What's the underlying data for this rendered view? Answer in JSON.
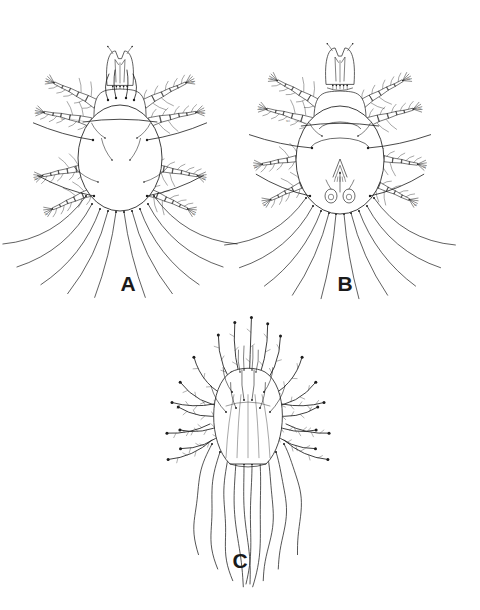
{
  "figure": {
    "type": "scientific-line-drawing",
    "background_color": "#ffffff",
    "ink_color": "#1c1c1c",
    "fine_ink_color": "#3a3a3a",
    "pale_ink_color": "#707070",
    "width": 480,
    "height": 610,
    "panel_count": 3
  },
  "panels": [
    {
      "id": "A",
      "label": "A",
      "view": "dorsal",
      "label_x": 128,
      "label_y": 291,
      "center_x": 120,
      "center_y": 150,
      "body": {
        "cx": 120,
        "cy": 158,
        "rx": 42,
        "ry": 53,
        "shield_top_y": 96,
        "shield_rx": 26,
        "shield_ry": 22,
        "shield_cy": 110,
        "transverse_suture_y": 120
      },
      "gnathosoma": {
        "cx": 120,
        "cy": 68,
        "width": 26,
        "height": 34
      },
      "legs": [
        {
          "name": "leg-I-left",
          "hx": 96,
          "hy": 104,
          "angle": 207,
          "segments": [
            11,
            10,
            9,
            8,
            9
          ],
          "width": 9,
          "taper": 0.74,
          "setae": 7,
          "tip_label": true
        },
        {
          "name": "leg-II-left",
          "hx": 90,
          "hy": 122,
          "angle": 192,
          "segments": [
            11,
            10,
            9,
            8,
            9
          ],
          "width": 9,
          "taper": 0.74,
          "setae": 6,
          "tip_label": true
        },
        {
          "name": "leg-III-left",
          "hx": 86,
          "hy": 168,
          "angle": 170,
          "segments": [
            10,
            9,
            9,
            8,
            8
          ],
          "width": 8,
          "taper": 0.76,
          "setae": 5,
          "tip_label": true
        },
        {
          "name": "leg-IV-left",
          "hx": 92,
          "hy": 192,
          "angle": 157,
          "segments": [
            10,
            9,
            8,
            8,
            8
          ],
          "width": 8,
          "taper": 0.76,
          "setae": 5,
          "tip_label": true
        },
        {
          "name": "leg-I-right",
          "hx": 144,
          "hy": 104,
          "angle": -27,
          "segments": [
            11,
            10,
            9,
            8,
            9
          ],
          "width": 9,
          "taper": 0.74,
          "setae": 7,
          "tip_label": true
        },
        {
          "name": "leg-II-right",
          "hx": 150,
          "hy": 122,
          "angle": -12,
          "segments": [
            11,
            10,
            9,
            8,
            9
          ],
          "width": 9,
          "taper": 0.74,
          "setae": 6,
          "tip_label": true
        },
        {
          "name": "leg-III-right",
          "hx": 154,
          "hy": 168,
          "angle": 10,
          "segments": [
            10,
            9,
            9,
            8,
            8
          ],
          "width": 8,
          "taper": 0.76,
          "setae": 5,
          "tip_label": true
        },
        {
          "name": "leg-IV-right",
          "hx": 148,
          "hy": 192,
          "angle": 23,
          "segments": [
            10,
            9,
            8,
            8,
            8
          ],
          "width": 8,
          "taper": 0.76,
          "setae": 5,
          "tip_label": true
        }
      ],
      "dorsal_setae": [
        {
          "x": 108,
          "y": 100,
          "angle": 272,
          "len": 26,
          "curve": -6,
          "weight": "heavy"
        },
        {
          "x": 116,
          "y": 98,
          "angle": 268,
          "len": 28,
          "curve": -3,
          "weight": "heavy"
        },
        {
          "x": 126,
          "y": 98,
          "angle": 272,
          "len": 28,
          "curve": 3,
          "weight": "heavy"
        },
        {
          "x": 134,
          "y": 100,
          "angle": 268,
          "len": 26,
          "curve": 6,
          "weight": "heavy"
        },
        {
          "x": 93,
          "y": 140,
          "angle": 196,
          "len": 62,
          "curve": -4,
          "weight": "heavy"
        },
        {
          "x": 147,
          "y": 140,
          "angle": -16,
          "len": 62,
          "curve": 4,
          "weight": "heavy"
        },
        {
          "x": 105,
          "y": 138,
          "angle": 228,
          "len": 20,
          "curve": -3,
          "weight": "light"
        },
        {
          "x": 137,
          "y": 138,
          "angle": -48,
          "len": 20,
          "curve": 3,
          "weight": "light"
        },
        {
          "x": 112,
          "y": 160,
          "angle": 244,
          "len": 24,
          "curve": -3,
          "weight": "light"
        },
        {
          "x": 130,
          "y": 160,
          "angle": -64,
          "len": 24,
          "curve": 3,
          "weight": "light"
        },
        {
          "x": 98,
          "y": 182,
          "angle": 212,
          "len": 28,
          "curve": -4,
          "weight": "light"
        },
        {
          "x": 144,
          "y": 182,
          "angle": -32,
          "len": 28,
          "curve": 4,
          "weight": "light"
        },
        {
          "x": 94,
          "y": 196,
          "angle": 200,
          "len": 60,
          "curve": -5,
          "weight": "heavy"
        },
        {
          "x": 147,
          "y": 196,
          "angle": -20,
          "len": 60,
          "curve": 5,
          "weight": "heavy"
        }
      ],
      "caudal_setae": [
        {
          "x": 86,
          "y": 196,
          "angle": 150,
          "len": 96,
          "curve": -22
        },
        {
          "x": 92,
          "y": 204,
          "angle": 140,
          "len": 98,
          "curve": -20
        },
        {
          "x": 100,
          "y": 209,
          "angle": 128,
          "len": 96,
          "curve": -16
        },
        {
          "x": 108,
          "y": 211,
          "angle": 116,
          "len": 92,
          "curve": -10
        },
        {
          "x": 116,
          "y": 212,
          "angle": 104,
          "len": 88,
          "curve": -5
        },
        {
          "x": 124,
          "y": 212,
          "angle": 76,
          "len": 88,
          "curve": 5
        },
        {
          "x": 132,
          "y": 211,
          "angle": 64,
          "len": 92,
          "curve": 10
        },
        {
          "x": 140,
          "y": 209,
          "angle": 52,
          "len": 96,
          "curve": 16
        },
        {
          "x": 148,
          "y": 204,
          "angle": 40,
          "len": 98,
          "curve": 20
        },
        {
          "x": 154,
          "y": 196,
          "angle": 30,
          "len": 96,
          "curve": 22
        }
      ],
      "micro_labels": [
        {
          "text": "sci",
          "x": 63,
          "y": 120,
          "leader_x2": 88,
          "leader_y2": 122
        }
      ]
    },
    {
      "id": "B",
      "label": "B",
      "view": "ventral",
      "label_x": 345,
      "label_y": 291,
      "center_x": 340,
      "center_y": 150,
      "body": {
        "cx": 340,
        "cy": 160,
        "rx": 44,
        "ry": 54,
        "shield_top_y": 98,
        "shield_rx": 26,
        "shield_ry": 22,
        "shield_cy": 112,
        "transverse_suture_y": 124
      },
      "gnathosoma": {
        "cx": 340,
        "cy": 66,
        "width": 28,
        "height": 36
      },
      "legs": [
        {
          "name": "leg-I-left",
          "hx": 318,
          "hy": 104,
          "angle": 210,
          "segments": [
            11,
            10,
            9,
            8,
            9
          ],
          "width": 9,
          "taper": 0.74,
          "setae": 7,
          "tip_label": true
        },
        {
          "name": "leg-II-left",
          "hx": 312,
          "hy": 122,
          "angle": 196,
          "segments": [
            11,
            10,
            9,
            8,
            9
          ],
          "width": 9,
          "taper": 0.74,
          "setae": 6,
          "tip_label": true
        },
        {
          "name": "leg-III-left",
          "hx": 306,
          "hy": 158,
          "angle": 172,
          "segments": [
            10,
            9,
            9,
            8,
            8
          ],
          "width": 8,
          "taper": 0.76,
          "setae": 5,
          "tip_label": true
        },
        {
          "name": "leg-IV-left",
          "hx": 310,
          "hy": 182,
          "angle": 156,
          "segments": [
            10,
            9,
            8,
            8,
            8
          ],
          "width": 8,
          "taper": 0.76,
          "setae": 5,
          "tip_label": true
        },
        {
          "name": "leg-I-right",
          "hx": 362,
          "hy": 104,
          "angle": -30,
          "segments": [
            11,
            10,
            9,
            8,
            9
          ],
          "width": 9,
          "taper": 0.74,
          "setae": 7,
          "tip_label": true
        },
        {
          "name": "leg-II-right",
          "hx": 368,
          "hy": 122,
          "angle": -16,
          "segments": [
            11,
            10,
            9,
            8,
            9
          ],
          "width": 9,
          "taper": 0.74,
          "setae": 6,
          "tip_label": true
        },
        {
          "name": "leg-III-right",
          "hx": 374,
          "hy": 158,
          "angle": 8,
          "segments": [
            10,
            9,
            9,
            8,
            8
          ],
          "width": 8,
          "taper": 0.76,
          "setae": 5,
          "tip_label": true
        },
        {
          "name": "leg-IV-right",
          "hx": 370,
          "hy": 182,
          "angle": 24,
          "segments": [
            10,
            9,
            8,
            8,
            8
          ],
          "width": 8,
          "taper": 0.76,
          "setae": 5,
          "tip_label": true
        }
      ],
      "ventral_structures": {
        "genital_opening": {
          "cx": 340,
          "cy": 168,
          "rx": 7,
          "ry": 9
        },
        "anal_plates": [
          {
            "cx": 331,
            "cy": 196,
            "rx": 6,
            "ry": 7
          },
          {
            "cx": 349,
            "cy": 196,
            "rx": 6,
            "ry": 7
          }
        ],
        "median_line": {
          "x": 340,
          "y1": 172,
          "y2": 192
        },
        "epimeral_arcs": [
          {
            "cx": 340,
            "cy": 132,
            "rx": 22,
            "ry": 10,
            "start": 200,
            "end": 340
          },
          {
            "cx": 340,
            "cy": 150,
            "rx": 30,
            "ry": 12,
            "start": 195,
            "end": 345
          }
        ]
      },
      "dorsal_setae": [
        {
          "x": 312,
          "y": 148,
          "angle": 192,
          "len": 64,
          "curve": -4,
          "weight": "heavy"
        },
        {
          "x": 368,
          "y": 148,
          "angle": -12,
          "len": 64,
          "curve": 4,
          "weight": "heavy"
        },
        {
          "x": 310,
          "y": 196,
          "angle": 202,
          "len": 58,
          "curve": -5,
          "weight": "heavy"
        },
        {
          "x": 370,
          "y": 196,
          "angle": -22,
          "len": 58,
          "curve": 5,
          "weight": "heavy"
        },
        {
          "x": 322,
          "y": 136,
          "angle": 226,
          "len": 18,
          "curve": -3,
          "weight": "light"
        },
        {
          "x": 358,
          "y": 136,
          "angle": -46,
          "len": 18,
          "curve": 3,
          "weight": "light"
        }
      ],
      "caudal_setae": [
        {
          "x": 306,
          "y": 198,
          "angle": 150,
          "len": 94,
          "curve": -22
        },
        {
          "x": 313,
          "y": 206,
          "angle": 140,
          "len": 96,
          "curve": -19
        },
        {
          "x": 321,
          "y": 211,
          "angle": 127,
          "len": 94,
          "curve": -14
        },
        {
          "x": 329,
          "y": 213,
          "angle": 114,
          "len": 90,
          "curve": -8
        },
        {
          "x": 336,
          "y": 214,
          "angle": 100,
          "len": 86,
          "curve": -4
        },
        {
          "x": 344,
          "y": 214,
          "angle": 80,
          "len": 86,
          "curve": 4
        },
        {
          "x": 351,
          "y": 213,
          "angle": 66,
          "len": 90,
          "curve": 8
        },
        {
          "x": 359,
          "y": 211,
          "angle": 53,
          "len": 94,
          "curve": 14
        },
        {
          "x": 367,
          "y": 206,
          "angle": 40,
          "len": 96,
          "curve": 19
        },
        {
          "x": 374,
          "y": 198,
          "angle": 30,
          "len": 94,
          "curve": 22
        }
      ],
      "micro_labels": [
        {
          "text": "sci",
          "x": 288,
          "y": 122,
          "leader_x2": 310,
          "leader_y2": 124
        }
      ]
    },
    {
      "id": "C",
      "label": "C",
      "view": "larva",
      "label_x": 240,
      "label_y": 568,
      "center_x": 248,
      "center_y": 420,
      "body": {
        "cx": 248,
        "cy": 420,
        "rx": 40,
        "ry": 46,
        "neck_y": 372,
        "neck_rx": 17,
        "posterior_flange_y": 464,
        "posterior_flange_rx": 18
      },
      "radial_setae": [
        {
          "angle": 250,
          "len": 62,
          "curve": -12,
          "beaded": true
        },
        {
          "angle": 262,
          "len": 70,
          "curve": -8,
          "beaded": true
        },
        {
          "angle": 272,
          "len": 74,
          "curve": 0,
          "beaded": true
        },
        {
          "angle": 282,
          "len": 70,
          "curve": 8,
          "beaded": true
        },
        {
          "angle": 292,
          "len": 62,
          "curve": 12,
          "beaded": true
        },
        {
          "angle": 228,
          "len": 56,
          "curve": -14,
          "beaded": true
        },
        {
          "angle": 312,
          "len": 56,
          "curve": 14,
          "beaded": true
        },
        {
          "angle": 208,
          "len": 52,
          "curve": -12,
          "beaded": true
        },
        {
          "angle": 332,
          "len": 52,
          "curve": 12,
          "beaded": true
        },
        {
          "angle": 190,
          "len": 46,
          "curve": -9,
          "beaded": true
        },
        {
          "angle": 350,
          "len": 46,
          "curve": 9,
          "beaded": true
        },
        {
          "angle": 172,
          "len": 44,
          "curve": -8,
          "beaded": true
        },
        {
          "angle": 8,
          "len": 44,
          "curve": 8,
          "beaded": true
        },
        {
          "angle": 158,
          "len": 48,
          "curve": -10,
          "beaded": true
        },
        {
          "angle": 22,
          "len": 48,
          "curve": 10,
          "beaded": true
        }
      ],
      "body_setae": [
        {
          "x": 232,
          "y": 392,
          "angle": 250,
          "len": 26,
          "curve": -4
        },
        {
          "x": 264,
          "y": 392,
          "angle": 290,
          "len": 26,
          "curve": 4
        },
        {
          "x": 226,
          "y": 412,
          "angle": 240,
          "len": 30,
          "curve": -4
        },
        {
          "x": 270,
          "y": 412,
          "angle": 300,
          "len": 30,
          "curve": 4
        },
        {
          "x": 236,
          "y": 408,
          "angle": 258,
          "len": 26,
          "curve": -3
        },
        {
          "x": 260,
          "y": 408,
          "angle": 282,
          "len": 26,
          "curve": 3
        },
        {
          "x": 244,
          "y": 400,
          "angle": 266,
          "len": 30,
          "curve": -2
        },
        {
          "x": 252,
          "y": 400,
          "angle": 274,
          "len": 30,
          "curve": 2
        }
      ],
      "whip_setae": [
        {
          "x": 220,
          "y": 452,
          "angle": 108,
          "len": 112,
          "curve": -34,
          "wave": 3
        },
        {
          "x": 228,
          "y": 458,
          "angle": 100,
          "len": 120,
          "curve": -26,
          "wave": 3
        },
        {
          "x": 236,
          "y": 462,
          "angle": 94,
          "len": 124,
          "curve": -16,
          "wave": 2
        },
        {
          "x": 244,
          "y": 464,
          "angle": 90,
          "len": 120,
          "curve": -6,
          "wave": 2
        },
        {
          "x": 252,
          "y": 464,
          "angle": 90,
          "len": 120,
          "curve": 6,
          "wave": 2
        },
        {
          "x": 260,
          "y": 462,
          "angle": 86,
          "len": 124,
          "curve": 16,
          "wave": 2
        },
        {
          "x": 268,
          "y": 458,
          "angle": 80,
          "len": 120,
          "curve": 26,
          "wave": 3
        },
        {
          "x": 276,
          "y": 452,
          "angle": 72,
          "len": 112,
          "curve": 34,
          "wave": 3
        },
        {
          "x": 212,
          "y": 444,
          "angle": 118,
          "len": 104,
          "curve": -40,
          "wave": 3
        },
        {
          "x": 284,
          "y": 444,
          "angle": 62,
          "len": 104,
          "curve": 40,
          "wave": 3
        }
      ],
      "lateral_setae": [
        {
          "x": 210,
          "y": 424,
          "angle": 168,
          "len": 44,
          "curve": -6,
          "beaded": true
        },
        {
          "x": 286,
          "y": 424,
          "angle": 12,
          "len": 44,
          "curve": 6,
          "beaded": true
        },
        {
          "x": 212,
          "y": 440,
          "angle": 156,
          "len": 48,
          "curve": -8,
          "beaded": true
        },
        {
          "x": 284,
          "y": 440,
          "angle": 24,
          "len": 48,
          "curve": 8,
          "beaded": true
        },
        {
          "x": 214,
          "y": 404,
          "angle": 182,
          "len": 42,
          "curve": -5,
          "beaded": true
        },
        {
          "x": 282,
          "y": 404,
          "angle": 358,
          "len": 42,
          "curve": 5,
          "beaded": true
        }
      ],
      "gnathosoma_setae": [
        {
          "x": 240,
          "y": 372,
          "angle": 266,
          "len": 22,
          "curve": -2
        },
        {
          "x": 244,
          "y": 370,
          "angle": 270,
          "len": 24,
          "curve": -1
        },
        {
          "x": 252,
          "y": 370,
          "angle": 272,
          "len": 24,
          "curve": 1
        },
        {
          "x": 256,
          "y": 372,
          "angle": 276,
          "len": 22,
          "curve": 2
        }
      ]
    }
  ]
}
